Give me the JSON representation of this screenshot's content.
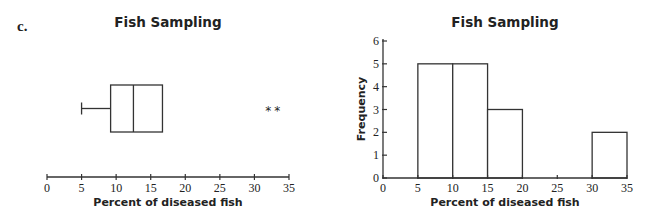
{
  "part_label": "c.",
  "chart_data": [
    {
      "type": "boxplot",
      "title": "Fish Sampling",
      "xlabel": "Percent of diseased fish",
      "ylabel": "",
      "xlim": [
        0,
        35
      ],
      "xticks": [
        0,
        5,
        10,
        15,
        20,
        25,
        30,
        35
      ],
      "grid": false,
      "box": {
        "min": 5,
        "q1": 9.2,
        "median": 12.5,
        "q3": 16.7,
        "whisker_high": 16.7
      },
      "outliers": [
        32,
        33.3
      ],
      "outlier_marker": "*"
    },
    {
      "type": "bar",
      "subtype": "histogram",
      "title": "Fish Sampling",
      "xlabel": "Percent of diseased fish",
      "ylabel": "Frequency",
      "xlim": [
        0,
        35
      ],
      "ylim": [
        0,
        6
      ],
      "xticks": [
        0,
        5,
        10,
        15,
        20,
        25,
        30,
        35
      ],
      "yticks": [
        0,
        1,
        2,
        3,
        4,
        5,
        6
      ],
      "grid": false,
      "bins": [
        [
          5,
          10
        ],
        [
          10,
          15
        ],
        [
          15,
          20
        ],
        [
          20,
          25
        ],
        [
          25,
          30
        ],
        [
          30,
          35
        ]
      ],
      "categories": [
        "5-10",
        "10-15",
        "15-20",
        "20-25",
        "25-30",
        "30-35"
      ],
      "values": [
        5,
        5,
        3,
        0,
        0,
        2
      ]
    }
  ]
}
